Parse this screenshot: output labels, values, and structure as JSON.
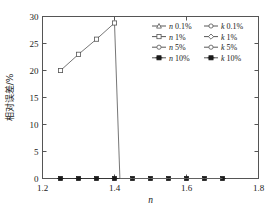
{
  "chart_data": {
    "type": "line",
    "title": "",
    "xlabel": "n",
    "ylabel": "相对误差/%",
    "xlim": [
      1.2,
      1.8
    ],
    "ylim": [
      0,
      30
    ],
    "xticks": [
      "1.2",
      "1.4",
      "1.6",
      "1.8"
    ],
    "xtick_values": [
      1.2,
      1.4,
      1.6,
      1.8
    ],
    "yticks": [
      "0",
      "5",
      "10",
      "15",
      "20",
      "25",
      "30"
    ],
    "ytick_values": [
      0,
      5,
      10,
      15,
      20,
      25,
      30
    ],
    "grid": false,
    "legend_position": "upper-right",
    "series": [
      {
        "name": "n 0.1%",
        "var": "n",
        "noise": "0.1%",
        "marker": "triangle-open",
        "x": [
          1.25,
          1.3,
          1.35,
          1.4,
          1.415,
          1.45,
          1.5,
          1.55,
          1.6,
          1.65,
          1.7
        ],
        "y": [
          20.0,
          23.0,
          25.8,
          28.8,
          0.0,
          0.0,
          0.0,
          0.0,
          0.0,
          0.0,
          0.0
        ]
      },
      {
        "name": "n 1%",
        "var": "n",
        "noise": "1%",
        "marker": "square-open",
        "x": [
          1.25,
          1.3,
          1.35,
          1.4,
          1.415,
          1.45,
          1.5,
          1.55,
          1.6,
          1.65,
          1.7
        ],
        "y": [
          20.0,
          23.0,
          25.8,
          28.8,
          0.0,
          0.0,
          0.0,
          0.0,
          0.0,
          0.0,
          0.0
        ]
      },
      {
        "name": "n 5%",
        "var": "n",
        "noise": "5%",
        "marker": "circle-open",
        "x": [
          1.25,
          1.3,
          1.35,
          1.4,
          1.415,
          1.45,
          1.5,
          1.55,
          1.6,
          1.65,
          1.7
        ],
        "y": [
          20.0,
          23.0,
          25.8,
          28.8,
          0.0,
          0.0,
          0.0,
          0.0,
          0.0,
          0.0,
          0.0
        ]
      },
      {
        "name": "n 10%",
        "var": "n",
        "noise": "10%",
        "marker": "star-filled",
        "x": [
          1.25,
          1.3,
          1.35,
          1.4,
          1.45,
          1.5,
          1.55,
          1.6,
          1.65,
          1.7
        ],
        "y": [
          0.0,
          0.0,
          0.0,
          0.0,
          0.0,
          0.0,
          0.0,
          0.0,
          0.0,
          0.0
        ]
      },
      {
        "name": "k 0.1%",
        "var": "k",
        "noise": "0.1%",
        "marker": "circle-open",
        "x": [
          1.25,
          1.3,
          1.35,
          1.4,
          1.45,
          1.5,
          1.55,
          1.6,
          1.65,
          1.7
        ],
        "y": [
          0.0,
          0.0,
          0.0,
          0.0,
          0.0,
          0.0,
          0.0,
          0.0,
          0.0,
          0.0
        ]
      },
      {
        "name": "k 1%",
        "var": "k",
        "noise": "1%",
        "marker": "diamond-open",
        "x": [
          1.25,
          1.3,
          1.35,
          1.4,
          1.45,
          1.5,
          1.55,
          1.6,
          1.65,
          1.7
        ],
        "y": [
          0.0,
          0.0,
          0.0,
          0.0,
          0.0,
          0.0,
          0.0,
          0.0,
          0.0,
          0.0
        ]
      },
      {
        "name": "k 5%",
        "var": "k",
        "noise": "5%",
        "marker": "circle-open",
        "x": [
          1.25,
          1.3,
          1.35,
          1.4,
          1.45,
          1.5,
          1.55,
          1.6,
          1.65,
          1.7
        ],
        "y": [
          0.0,
          0.0,
          0.0,
          0.0,
          0.0,
          0.0,
          0.0,
          0.0,
          0.0,
          0.0
        ]
      },
      {
        "name": "k 10%",
        "var": "k",
        "noise": "10%",
        "marker": "star-filled",
        "x": [
          1.25,
          1.3,
          1.35,
          1.4,
          1.45,
          1.5,
          1.55,
          1.6,
          1.65,
          1.7
        ],
        "y": [
          0.0,
          0.0,
          0.0,
          0.0,
          0.0,
          0.0,
          0.0,
          0.0,
          0.0,
          0.0
        ]
      }
    ]
  },
  "legend": {
    "rows": [
      {
        "left_var": "n",
        "left_pct": " 0.1%",
        "right_var": "k",
        "right_pct": " 0.1%"
      },
      {
        "left_var": "n",
        "left_pct": " 1%",
        "right_var": "k",
        "right_pct": " 1%"
      },
      {
        "left_var": "n",
        "left_pct": " 5%",
        "right_var": "k",
        "right_pct": " 5%"
      },
      {
        "left_var": "n",
        "left_pct": " 10%",
        "right_var": "k",
        "right_pct": " 10%"
      }
    ]
  },
  "colors": {
    "axis": "#555555",
    "rising_line": "#666666",
    "flat_line": "#333333",
    "text": "#1a1a1a",
    "background": "#ffffff"
  }
}
